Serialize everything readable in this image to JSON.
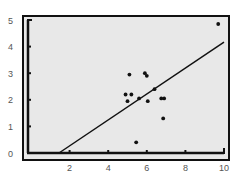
{
  "chart_data": {
    "type": "scatter",
    "title": "",
    "xlabel": "",
    "ylabel": "",
    "xlim": [
      0,
      10
    ],
    "ylim": [
      0,
      5
    ],
    "x_ticks": [
      2,
      4,
      6,
      8,
      10
    ],
    "y_ticks": [
      0,
      1,
      2,
      3,
      4,
      5
    ],
    "grid": false,
    "legend": null,
    "series": [
      {
        "name": "points",
        "points": [
          {
            "x": 5.1,
            "y": 2.95
          },
          {
            "x": 5.9,
            "y": 3.0
          },
          {
            "x": 6.0,
            "y": 2.9
          },
          {
            "x": 4.9,
            "y": 2.2
          },
          {
            "x": 5.2,
            "y": 2.2
          },
          {
            "x": 5.0,
            "y": 1.95
          },
          {
            "x": 5.6,
            "y": 2.05
          },
          {
            "x": 6.4,
            "y": 2.4
          },
          {
            "x": 6.05,
            "y": 1.95
          },
          {
            "x": 6.75,
            "y": 2.05
          },
          {
            "x": 6.9,
            "y": 2.05
          },
          {
            "x": 6.85,
            "y": 1.3
          },
          {
            "x": 5.45,
            "y": 0.4
          },
          {
            "x": 9.7,
            "y": 4.85
          }
        ]
      },
      {
        "name": "regression line",
        "type": "line",
        "points": [
          {
            "x": 1.45,
            "y": 0
          },
          {
            "x": 10,
            "y": 4.17
          }
        ]
      }
    ]
  },
  "colors": {
    "background": "#ffffff",
    "plot_area": "#e8e8e8",
    "ink": "#111111",
    "label": "#555555"
  }
}
